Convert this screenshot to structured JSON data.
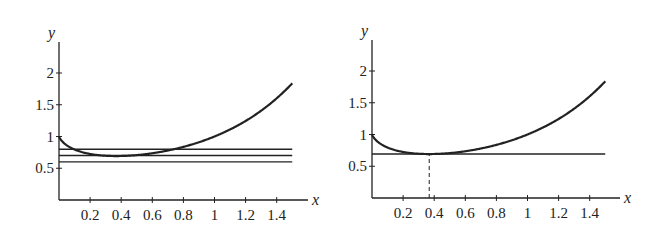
{
  "chart_data": [
    {
      "type": "line",
      "title": "",
      "xlabel": "x",
      "ylabel": "y",
      "xlim": [
        0,
        1.6
      ],
      "ylim": [
        0,
        2.4
      ],
      "x_ticks": [
        "0.2",
        "0.4",
        "0.6",
        "0.8",
        "1",
        "1.2",
        "1.4"
      ],
      "y_ticks": [
        "0.5",
        "1",
        "1.5",
        "2"
      ],
      "grid": false,
      "series": [
        {
          "name": "y = x^x",
          "function": "x^x",
          "x_range": [
            0,
            1.5
          ],
          "x": [
            0.0,
            0.1,
            0.2,
            0.3,
            0.368,
            0.5,
            0.6,
            0.8,
            1.0,
            1.2,
            1.4,
            1.5
          ],
          "values": [
            1.0,
            0.794,
            0.725,
            0.697,
            0.692,
            0.707,
            0.736,
            0.837,
            1.0,
            1.245,
            1.602,
            1.837
          ]
        },
        {
          "name": "horizontal line y=0.8",
          "x": [
            0,
            1.5
          ],
          "values": [
            0.8,
            0.8
          ]
        },
        {
          "name": "horizontal line y=0.7",
          "x": [
            0,
            1.5
          ],
          "values": [
            0.7,
            0.7
          ]
        },
        {
          "name": "horizontal line y=0.6",
          "x": [
            0,
            1.5
          ],
          "values": [
            0.6,
            0.6
          ]
        }
      ]
    },
    {
      "type": "line",
      "title": "",
      "xlabel": "x",
      "ylabel": "y",
      "xlim": [
        0,
        1.6
      ],
      "ylim": [
        0,
        2.4
      ],
      "x_ticks": [
        "0.2",
        "0.4",
        "0.6",
        "0.8",
        "1",
        "1.2",
        "1.4"
      ],
      "y_ticks": [
        "0.5",
        "1",
        "1.5",
        "2"
      ],
      "grid": false,
      "series": [
        {
          "name": "y = x^x",
          "function": "x^x",
          "x_range": [
            0,
            1.5
          ],
          "x": [
            0.0,
            0.1,
            0.2,
            0.3,
            0.368,
            0.5,
            0.6,
            0.8,
            1.0,
            1.2,
            1.4,
            1.5
          ],
          "values": [
            1.0,
            0.794,
            0.725,
            0.697,
            0.692,
            0.707,
            0.736,
            0.837,
            1.0,
            1.245,
            1.602,
            1.837
          ]
        },
        {
          "name": "tangent line at minimum y=0.692",
          "x": [
            0,
            1.5
          ],
          "values": [
            0.692,
            0.692
          ]
        }
      ],
      "annotations": [
        {
          "type": "dashed-vertical",
          "x": 0.368,
          "from_y": 0,
          "to_y": 0.692,
          "label": "minimum at x = 1/e"
        }
      ]
    }
  ],
  "charts": [
    {
      "id": "left",
      "origin_px": [
        59,
        200
      ],
      "x_scale": 155.5,
      "y_scale": 63.5,
      "x_end_px": 308,
      "y_top_px": 42,
      "hlines": [
        0.8,
        0.7,
        0.6
      ],
      "dashed_x": null
    },
    {
      "id": "right",
      "origin_px": [
        372,
        198
      ],
      "x_scale": 155.5,
      "y_scale": 63.5,
      "x_end_px": 620,
      "y_top_px": 40,
      "hlines": [
        0.692
      ],
      "dashed_x": 0.368
    }
  ],
  "labels": {
    "x_axis": "x",
    "y_axis": "y",
    "x_ticks": [
      "0.2",
      "0.4",
      "0.6",
      "0.8",
      "1",
      "1.2",
      "1.4"
    ],
    "y_ticks": [
      "0.5",
      "1",
      "1.5",
      "2"
    ]
  },
  "colors": {
    "ink": "#222222",
    "background": "#ffffff"
  }
}
